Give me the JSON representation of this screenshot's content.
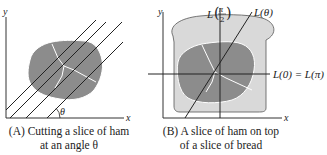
{
  "colors": {
    "ham": "#8c8c8c",
    "ham_edge": "#ffffff",
    "bread": "#d9d9d9",
    "bread_edge": "#555555",
    "line": "#222222",
    "axis": "#333333"
  },
  "panel_a": {
    "axis_x": "x",
    "axis_y": "y",
    "angle_label": "θ",
    "caption_line1": "(A) Cutting a slice of ham",
    "caption_line2": "at an angle θ"
  },
  "panel_b": {
    "axis_x": "x",
    "axis_y": "y",
    "label_vertical": "L(π/2)",
    "label_vertical_prefix": "L",
    "label_vertical_num": "π",
    "label_vertical_den": "2",
    "label_diagonal": "L(θ)",
    "label_horizontal": "L(0) = L(π)",
    "caption_line1": "(B) A slice of ham on top",
    "caption_line2": "of a slice of bread"
  }
}
